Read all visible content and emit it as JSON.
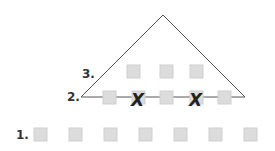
{
  "diagram": {
    "labels": {
      "row1": "1.",
      "row2": "2.",
      "row3": "3."
    },
    "triangle": {
      "apex": [
        163,
        15
      ],
      "left": [
        81,
        97
      ],
      "right": [
        245,
        97
      ]
    },
    "row1": {
      "y": 128,
      "xs": [
        34,
        69,
        104,
        139,
        174,
        209,
        244
      ],
      "crossed": []
    },
    "row2": {
      "y": 91,
      "xs": [
        103,
        132,
        160,
        190,
        218
      ],
      "crossed": [
        1,
        3
      ]
    },
    "row3": {
      "y": 65,
      "xs": [
        127,
        160,
        190
      ],
      "crossed": []
    },
    "cross_mark": "X",
    "colors": {
      "square": "#dcdcdc",
      "line": "#555555",
      "label": "#333333"
    }
  }
}
